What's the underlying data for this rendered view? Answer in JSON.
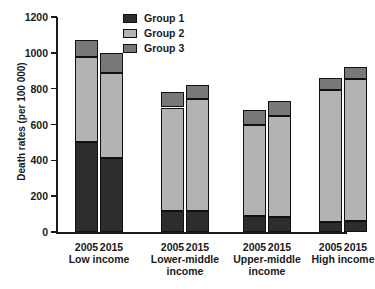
{
  "chart_data": {
    "type": "bar",
    "subtype": "stacked",
    "title": "",
    "xlabel": "",
    "ylabel": "Death rates (per 100 000)",
    "ylim": [
      0,
      1200
    ],
    "yticks": [
      0,
      200,
      400,
      600,
      800,
      1000,
      1200
    ],
    "ytick_labels": [
      "0",
      "200",
      "400",
      "600",
      "800",
      "1000",
      "1200"
    ],
    "grid": false,
    "legend_position": "top-center",
    "categories": [
      "2005",
      "2015",
      "2005",
      "2015",
      "2005",
      "2015",
      "2005",
      "2015"
    ],
    "category_groups": [
      {
        "label": "Low income",
        "years": [
          "2005",
          "2015"
        ]
      },
      {
        "label": "Lower-middle income",
        "years": [
          "2005",
          "2015"
        ]
      },
      {
        "label": "Upper-middle income",
        "years": [
          "2005",
          "2015"
        ]
      },
      {
        "label": "High income",
        "years": [
          "2005",
          "2015"
        ]
      }
    ],
    "series": [
      {
        "name": "Group 1",
        "color": "#2d2d2d",
        "values": [
          500,
          415,
          115,
          115,
          90,
          85,
          55,
          60
        ]
      },
      {
        "name": "Group 2",
        "color": "#b3b3b3",
        "values": [
          475,
          475,
          580,
          625,
          510,
          565,
          740,
          795
        ]
      },
      {
        "name": "Group 3",
        "color": "#787878",
        "values": [
          95,
          110,
          85,
          80,
          80,
          80,
          65,
          65
        ]
      }
    ],
    "totals": [
      1070,
      1000,
      780,
      820,
      680,
      730,
      860,
      920
    ]
  },
  "legend": {
    "items": [
      {
        "label": "Group 1",
        "color": "#2d2d2d"
      },
      {
        "label": "Group 2",
        "color": "#b3b3b3"
      },
      {
        "label": "Group 3",
        "color": "#787878"
      }
    ]
  }
}
